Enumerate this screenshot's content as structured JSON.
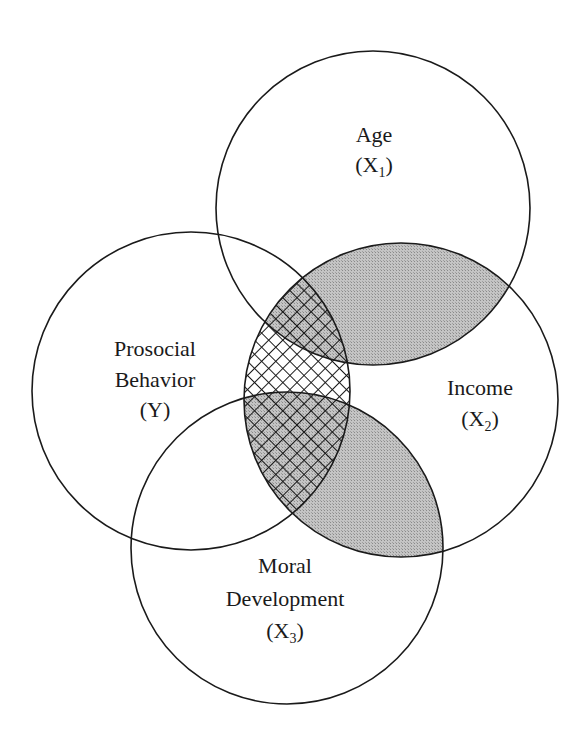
{
  "diagram": {
    "type": "venn",
    "circles": [
      {
        "id": "y",
        "label_lines": [
          "Prosocial",
          "Behavior",
          "(Y)"
        ],
        "cx": 191,
        "cy": 391,
        "r": 159,
        "label_name": "Prosocial Behavior",
        "symbol": "Y",
        "subscript": ""
      },
      {
        "id": "x1",
        "label_lines": [
          "Age"
        ],
        "cx": 373,
        "cy": 208,
        "r": 157,
        "label_name": "Age",
        "symbol": "X",
        "subscript": "1"
      },
      {
        "id": "x2",
        "label_lines": [
          "Income"
        ],
        "cx": 401,
        "cy": 400,
        "r": 157,
        "label_name": "Income",
        "symbol": "X",
        "subscript": "2"
      },
      {
        "id": "x3",
        "label_lines": [
          "Moral",
          "Development"
        ],
        "cx": 287,
        "cy": 548,
        "r": 156,
        "label_name": "Moral Development",
        "symbol": "X",
        "subscript": "3"
      }
    ],
    "labels": {
      "age": {
        "line1": "Age",
        "paren_open": "(X",
        "sub": "1",
        "paren_close": ")"
      },
      "prosocial": {
        "line1": "Prosocial",
        "line2": "Behavior",
        "line3": "(Y)"
      },
      "income": {
        "line1": "Income",
        "paren_open": "(X",
        "sub": "2",
        "paren_close": ")"
      },
      "moral": {
        "line1": "Moral",
        "line2": "Development",
        "paren_open": "(X",
        "sub": "3",
        "paren_close": ")"
      }
    },
    "shading": {
      "gray_regions": [
        "X1 ∩ X2",
        "X2 ∩ X3"
      ],
      "crosshatch_regions": [
        "Y ∩ X2"
      ],
      "gray_color": "#b8b8b8",
      "line_color": "#1a1a1a"
    }
  }
}
